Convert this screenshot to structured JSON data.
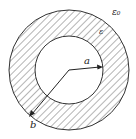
{
  "diagram": {
    "center": [
      69,
      70
    ],
    "inner_radius_px": 34,
    "outer_radius_px": 60,
    "colors": {
      "stroke": "#333333",
      "hatch": "#444444",
      "background": "#ffffff"
    },
    "labels": {
      "outer_medium": "ε₀",
      "dielectric": "ε",
      "inner_radius": "a",
      "outer_radius": "b"
    }
  }
}
